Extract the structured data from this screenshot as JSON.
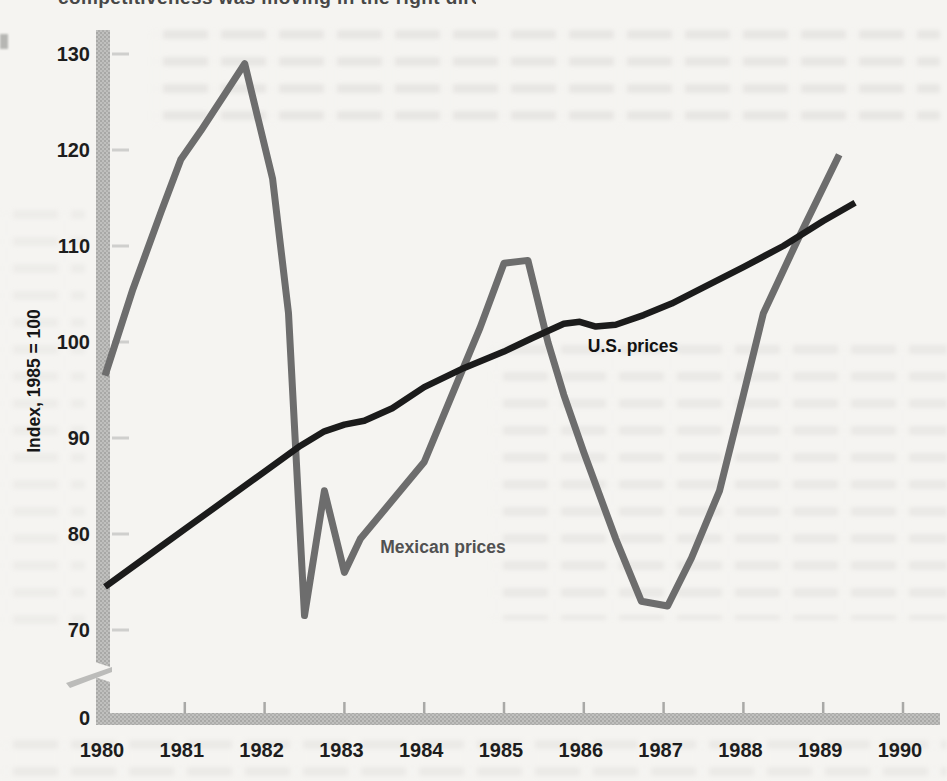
{
  "page": {
    "top_clipped_text": "competitiveness was moving in the right direction over the decade"
  },
  "chart_data": {
    "type": "line",
    "title": "",
    "xlabel": "",
    "ylabel": "Index, 1985 = 100",
    "x_ticks": [
      1980,
      1981,
      1982,
      1983,
      1984,
      1985,
      1986,
      1987,
      1988,
      1989,
      1990
    ],
    "y_ticks": [
      0,
      70,
      80,
      90,
      100,
      110,
      120,
      130
    ],
    "y_axis_break_between": [
      0,
      70
    ],
    "xlim": [
      1980,
      1990.5
    ],
    "ylim": [
      70,
      131
    ],
    "grid": false,
    "legend": "inline-labels",
    "axis_bar_color": "#bcbcba",
    "series": [
      {
        "name": "Mexican prices",
        "color": "#6d6d6d",
        "label": {
          "year": 1983.45,
          "value": 78.0
        },
        "points": [
          [
            1980.0,
            96.5
          ],
          [
            1980.35,
            105.5
          ],
          [
            1980.7,
            113.5
          ],
          [
            1980.95,
            119.0
          ],
          [
            1981.2,
            122.0
          ],
          [
            1981.5,
            125.8
          ],
          [
            1981.75,
            129.0
          ],
          [
            1982.1,
            117.0
          ],
          [
            1982.3,
            103.0
          ],
          [
            1982.5,
            71.5
          ],
          [
            1982.75,
            84.5
          ],
          [
            1983.0,
            76.0
          ],
          [
            1983.2,
            79.5
          ],
          [
            1983.7,
            84.5
          ],
          [
            1984.0,
            87.5
          ],
          [
            1984.4,
            95.5
          ],
          [
            1984.7,
            101.5
          ],
          [
            1985.0,
            108.2
          ],
          [
            1985.3,
            108.5
          ],
          [
            1985.55,
            100.0
          ],
          [
            1985.75,
            94.5
          ],
          [
            1986.0,
            88.5
          ],
          [
            1986.4,
            79.5
          ],
          [
            1986.72,
            73.0
          ],
          [
            1987.05,
            72.5
          ],
          [
            1987.35,
            77.5
          ],
          [
            1987.7,
            84.5
          ],
          [
            1988.0,
            94.5
          ],
          [
            1988.25,
            103.0
          ],
          [
            1988.7,
            111.0
          ],
          [
            1989.2,
            119.5
          ]
        ]
      },
      {
        "name": "U.S. prices",
        "color": "#1b1b1b",
        "label": {
          "year": 1986.05,
          "value": 99.0
        },
        "points": [
          [
            1980.0,
            74.5
          ],
          [
            1980.5,
            77.5
          ],
          [
            1981.0,
            80.5
          ],
          [
            1981.5,
            83.5
          ],
          [
            1982.0,
            86.5
          ],
          [
            1982.45,
            89.2
          ],
          [
            1982.75,
            90.7
          ],
          [
            1983.0,
            91.4
          ],
          [
            1983.25,
            91.8
          ],
          [
            1983.6,
            93.1
          ],
          [
            1984.0,
            95.3
          ],
          [
            1984.5,
            97.3
          ],
          [
            1985.0,
            99.0
          ],
          [
            1985.35,
            100.4
          ],
          [
            1985.75,
            101.9
          ],
          [
            1985.95,
            102.1
          ],
          [
            1986.15,
            101.6
          ],
          [
            1986.4,
            101.8
          ],
          [
            1986.75,
            102.8
          ],
          [
            1987.1,
            104.0
          ],
          [
            1987.5,
            105.7
          ],
          [
            1988.0,
            107.8
          ],
          [
            1988.5,
            110.0
          ],
          [
            1989.0,
            112.6
          ],
          [
            1989.4,
            114.5
          ]
        ]
      }
    ]
  }
}
